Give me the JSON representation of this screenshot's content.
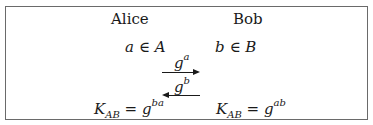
{
  "parties": {
    "alice": {
      "name": "Alice",
      "secret_var": "a",
      "secret_set": "A",
      "key_label": "K",
      "key_sub": "AB",
      "key_base": "g",
      "key_exp": "ba"
    },
    "bob": {
      "name": "Bob",
      "secret_var": "b",
      "secret_set": "B",
      "key_label": "K",
      "key_sub": "AB",
      "key_base": "g",
      "key_exp": "ab"
    }
  },
  "symbols": {
    "element_of": "∈",
    "equals": "="
  },
  "messages": [
    {
      "direction": "right",
      "base": "g",
      "exp": "a"
    },
    {
      "direction": "left",
      "base": "g",
      "exp": "b"
    }
  ]
}
